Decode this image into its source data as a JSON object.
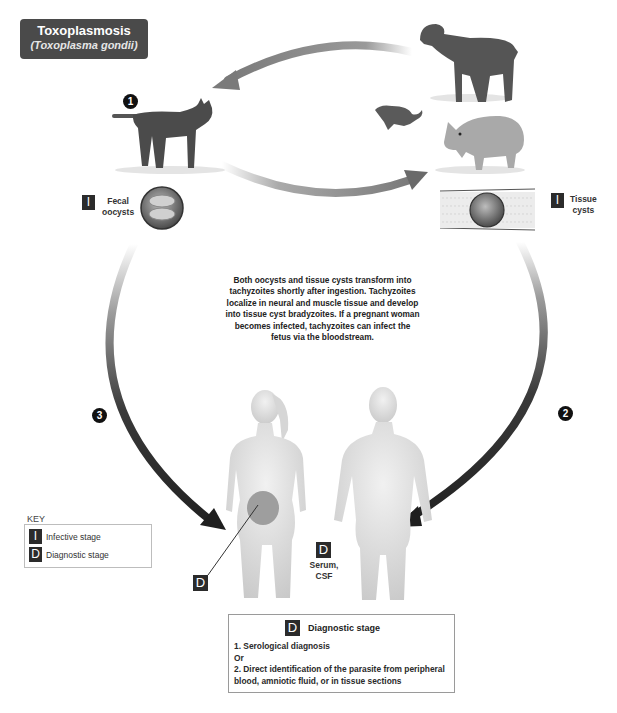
{
  "title": {
    "main": "Toxoplasmosis",
    "subtitle": "(Toxoplasma gondii)"
  },
  "steps": [
    {
      "number": "1",
      "label": "Cat (definitive host)"
    },
    {
      "number": "2",
      "label": "Tissue cysts to human"
    },
    {
      "number": "3",
      "label": "Fecal oocysts to human"
    }
  ],
  "hosts": {
    "definitive": "cat",
    "intermediate": [
      "sheep",
      "rodent",
      "pig"
    ],
    "human": [
      "pregnant woman",
      "man"
    ]
  },
  "stages": {
    "fecal_oocysts": {
      "badge": "I",
      "label_line1": "Fecal",
      "label_line2": "oocysts"
    },
    "tissue_cysts": {
      "badge": "I",
      "label_line1": "Tissue",
      "label_line2": "cysts"
    }
  },
  "description": "Both oocysts and tissue cysts transform into tachyzoites shortly after ingestion. Tachyzoites localize in neural and muscle tissue and develop into tissue cyst bradyzoites. If a pregnant woman becomes infected, tachyzoites can infect the fetus via the bloodstream.",
  "human_markers": {
    "fetus_badge": "D",
    "serum_badge": "D",
    "serum_line1": "Serum,",
    "serum_line2": "CSF"
  },
  "key": {
    "title": "KEY",
    "items": [
      {
        "badge": "I",
        "label": "Infective stage"
      },
      {
        "badge": "D",
        "label": "Diagnostic stage"
      }
    ]
  },
  "diagnostic_box": {
    "badge": "D",
    "heading": "Diagnostic stage",
    "lines": [
      "1. Serological diagnosis",
      "Or",
      "2. Direct identification of the parasite from peripheral blood, amniotic fluid, or in tissue sections"
    ]
  },
  "colors": {
    "title_bg": "#4a4a4a",
    "badge_bg": "#2b2b2b",
    "arrow_dark": "#2e2e2e",
    "arrow_light": "#bdbdbd"
  }
}
